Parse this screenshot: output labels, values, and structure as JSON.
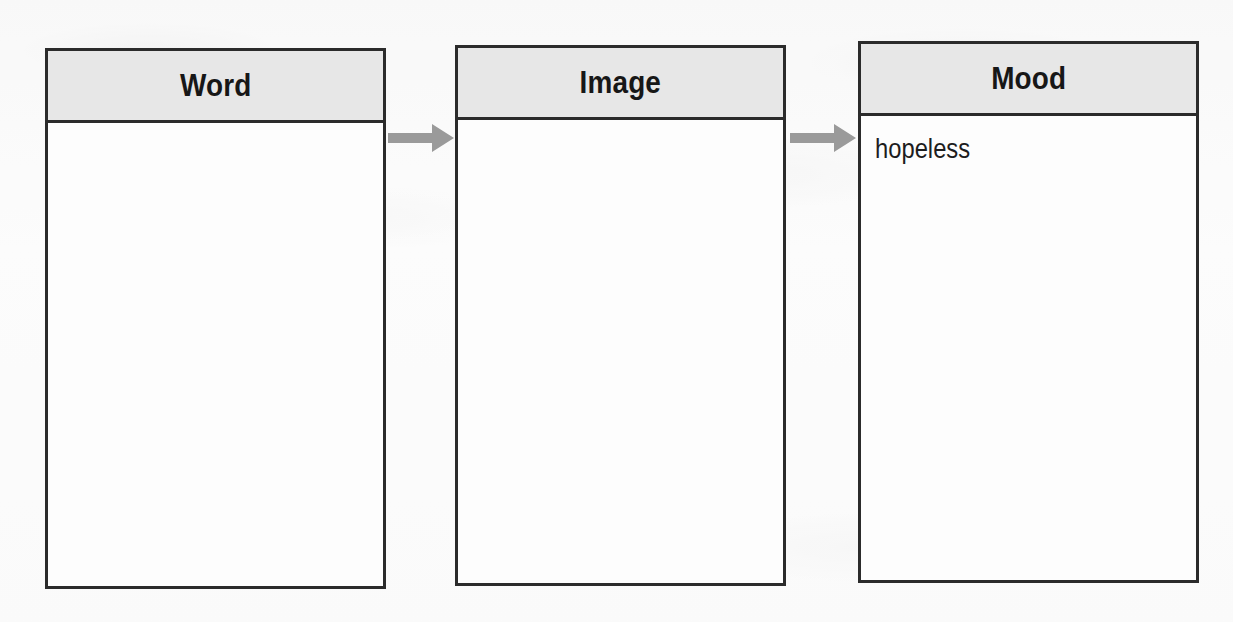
{
  "diagram": {
    "type": "flow-chain",
    "nodes": [
      {
        "id": "word",
        "header": "Word",
        "entries": []
      },
      {
        "id": "image",
        "header": "Image",
        "entries": []
      },
      {
        "id": "mood",
        "header": "Mood",
        "entries": [
          "hopeless"
        ]
      }
    ],
    "connectors": [
      {
        "id": "word-to-image",
        "from": "word",
        "to": "image",
        "glyph": "right-arrow"
      },
      {
        "id": "image-to-mood",
        "from": "image",
        "to": "mood",
        "glyph": "right-arrow"
      }
    ],
    "colors": {
      "page_background": "#fbfbfb",
      "box_border": "#2b2b2b",
      "header_fill": "#e7e7e7",
      "box_fill": "#fdfdfd",
      "title_text": "#171717",
      "entry_text": "#1d1d1d",
      "arrow_fill": "#9a9a9a"
    }
  }
}
